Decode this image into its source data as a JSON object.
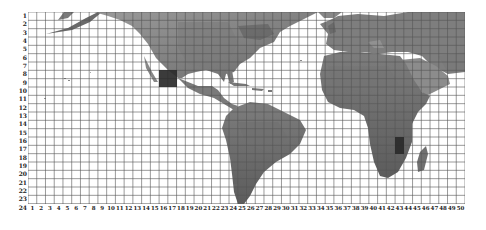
{
  "map": {
    "type": "world-grid-map",
    "projection": "equirectangular",
    "render": "grayscale-relief",
    "grid": {
      "columns": 50,
      "rows": 24,
      "line_color": "#555555",
      "row_labels": [
        "1",
        "2",
        "3",
        "4",
        "5",
        "6",
        "7",
        "8",
        "9",
        "10",
        "11",
        "12",
        "13",
        "14",
        "15",
        "16",
        "17",
        "18",
        "19",
        "20",
        "21",
        "22",
        "23",
        "24"
      ],
      "column_labels": [
        "1",
        "2",
        "3",
        "4",
        "5",
        "6",
        "7",
        "8",
        "9",
        "10",
        "11",
        "12",
        "13",
        "14",
        "15",
        "16",
        "17",
        "18",
        "19",
        "20",
        "21",
        "22",
        "23",
        "24",
        "25",
        "26",
        "27",
        "28",
        "29",
        "30",
        "31",
        "32",
        "33",
        "34",
        "35",
        "36",
        "37",
        "38",
        "39",
        "40",
        "41",
        "42",
        "43",
        "44",
        "45",
        "46",
        "47",
        "48",
        "49",
        "50"
      ]
    },
    "highlighted_cells": [
      {
        "label": "Mexico",
        "col_start": 16,
        "col_end": 17,
        "row_start": 8,
        "row_end": 9,
        "color": "#2a2a2a"
      },
      {
        "label": "Mozambique / Southeast Africa",
        "col_start": 43,
        "col_end": 43,
        "row_start": 16,
        "row_end": 17,
        "color": "#2a2a2a"
      }
    ],
    "landmasses": [
      "North America",
      "Central America",
      "Caribbean",
      "South America",
      "Greenland (partial)",
      "Europe",
      "Africa",
      "Middle East",
      "Madagascar"
    ],
    "colors": {
      "land": "#8a8a8a",
      "land_dark": "#5e5e5e",
      "ocean": "#ffffff",
      "highlight": "#2a2a2a"
    }
  }
}
